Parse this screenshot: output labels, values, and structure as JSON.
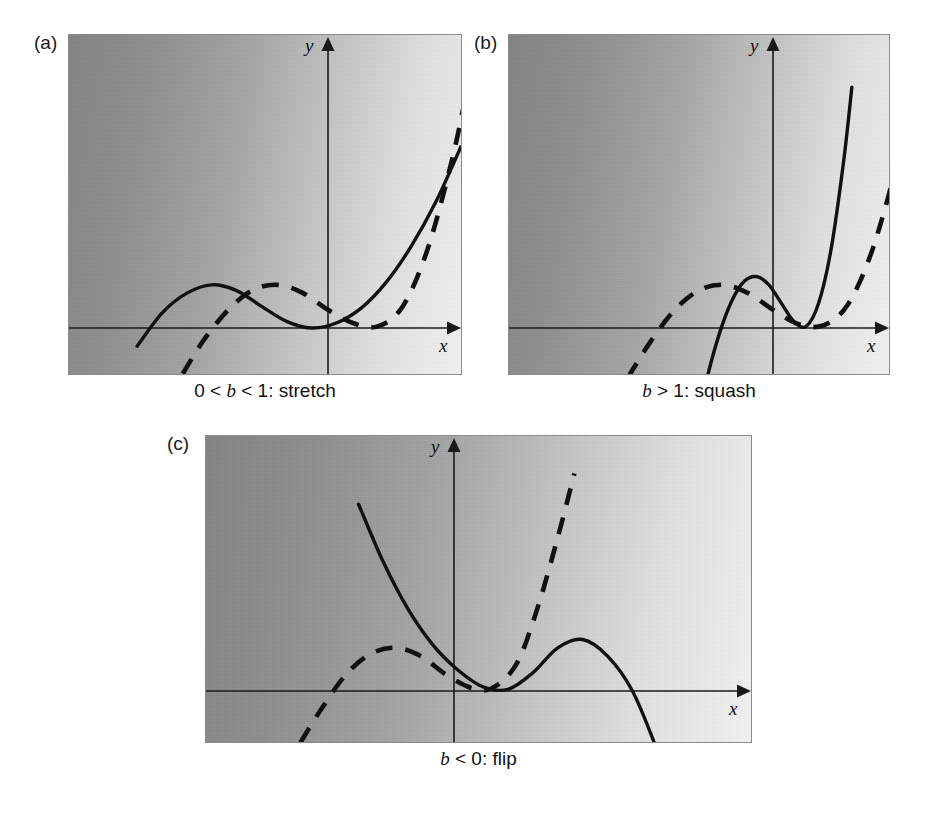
{
  "figure": {
    "background": "#ffffff",
    "curve_color": "#111111",
    "axis_color": "#1a1a1a",
    "panel_border_color": "#8c8c8c",
    "gradient_from": "#848484",
    "gradient_to": "#f4f4f4"
  },
  "panels": [
    {
      "id": "a",
      "label": "(a)",
      "caption_prefix": "0 < ",
      "caption_var": "b",
      "caption_suffix": " < 1: stretch",
      "caption_full": "0 < b < 1: stretch",
      "x_axis_label": "x",
      "y_axis_label": "y",
      "box": {
        "left": 68,
        "top": 34,
        "width": 394,
        "height": 341
      },
      "origin": {
        "x": 259,
        "y": 293
      },
      "label_pos": {
        "left": 34,
        "top": 32
      },
      "caption_pos": {
        "left": 68,
        "top": 380,
        "width": 394
      }
    },
    {
      "id": "b",
      "label": "(b)",
      "caption_prefix": "",
      "caption_var": "b",
      "caption_suffix": " > 1: squash",
      "caption_full": "b > 1: squash",
      "x_axis_label": "x",
      "y_axis_label": "y",
      "box": {
        "left": 508,
        "top": 34,
        "width": 382,
        "height": 341
      },
      "origin": {
        "x": 264,
        "y": 293
      },
      "label_pos": {
        "left": 474,
        "top": 32
      },
      "caption_pos": {
        "left": 508,
        "top": 380,
        "width": 382
      }
    },
    {
      "id": "c",
      "label": "(c)",
      "caption_prefix": "",
      "caption_var": "b",
      "caption_suffix": " < 0: flip",
      "caption_full": "b < 0: flip",
      "x_axis_label": "x",
      "y_axis_label": "y",
      "box": {
        "left": 205,
        "top": 435,
        "width": 547,
        "height": 308
      },
      "origin": {
        "x": 248,
        "y": 255
      },
      "label_pos": {
        "left": 167,
        "top": 433
      },
      "caption_pos": {
        "left": 205,
        "top": 748,
        "width": 547
      }
    }
  ],
  "chart_data": {
    "type": "line",
    "xlabel": "x",
    "ylabel": "y",
    "grid": false,
    "legend": "none",
    "annotations": [
      "(a) 0 < b < 1: stretch",
      "(b) b > 1: squash",
      "(c) b < 0: flip"
    ],
    "base_function": {
      "name": "f(x)",
      "form": "cubic with local max then local min then rising",
      "roots_x": [
        -1.35,
        0.55,
        0.55
      ],
      "local_max_x": -0.75,
      "local_min_x": 0.55,
      "expression": "k*(x + 1.35)*(x - 0.55)^2",
      "k": 1.0
    },
    "panels": [
      {
        "id": "a",
        "caption": "0 < b < 1: stretch",
        "solid": {
          "style": "solid",
          "name": "y = f(bx), 0 < b < 1",
          "b": 0.6,
          "points_xy": [
            [
              -2.3,
              -0.22
            ],
            [
              -2.0,
              0.18
            ],
            [
              -1.7,
              0.42
            ],
            [
              -1.4,
              0.52
            ],
            [
              -1.1,
              0.45
            ],
            [
              -0.8,
              0.26
            ],
            [
              -0.5,
              0.08
            ],
            [
              -0.2,
              0.0
            ],
            [
              0.1,
              0.06
            ],
            [
              0.4,
              0.24
            ],
            [
              0.7,
              0.55
            ],
            [
              1.0,
              0.98
            ],
            [
              1.3,
              1.52
            ],
            [
              1.6,
              2.18
            ]
          ]
        },
        "dashed": {
          "style": "dashed",
          "name": "y = f(x) original",
          "b": 1.0,
          "points_xy": [
            [
              -1.75,
              -0.55
            ],
            [
              -1.5,
              -0.15
            ],
            [
              -1.2,
              0.22
            ],
            [
              -0.9,
              0.46
            ],
            [
              -0.6,
              0.52
            ],
            [
              -0.3,
              0.42
            ],
            [
              0.0,
              0.22
            ],
            [
              0.3,
              0.06
            ],
            [
              0.6,
              0.02
            ],
            [
              0.9,
              0.26
            ],
            [
              1.2,
              0.95
            ],
            [
              1.5,
              2.05
            ],
            [
              1.7,
              3.0
            ]
          ]
        }
      },
      {
        "id": "b",
        "caption": "b > 1: squash",
        "solid": {
          "style": "solid",
          "name": "y = f(bx), b > 1",
          "b": 1.7,
          "points_xy": [
            [
              -0.95,
              -1.25
            ],
            [
              -0.8,
              -0.62
            ],
            [
              -0.65,
              -0.08
            ],
            [
              -0.5,
              0.32
            ],
            [
              -0.35,
              0.56
            ],
            [
              -0.2,
              0.62
            ],
            [
              -0.05,
              0.52
            ],
            [
              0.1,
              0.3
            ],
            [
              0.25,
              0.08
            ],
            [
              0.4,
              0.02
            ],
            [
              0.55,
              0.3
            ],
            [
              0.7,
              0.95
            ],
            [
              0.85,
              2.0
            ],
            [
              0.95,
              2.9
            ]
          ]
        },
        "dashed": {
          "style": "dashed",
          "name": "y = f(x) original",
          "b": 1.0,
          "points_xy": [
            [
              -1.75,
              -0.6
            ],
            [
              -1.5,
              -0.2
            ],
            [
              -1.2,
              0.2
            ],
            [
              -0.9,
              0.45
            ],
            [
              -0.6,
              0.52
            ],
            [
              -0.3,
              0.42
            ],
            [
              0.0,
              0.22
            ],
            [
              0.3,
              0.05
            ],
            [
              0.6,
              0.03
            ],
            [
              0.9,
              0.28
            ],
            [
              1.2,
              0.95
            ],
            [
              1.5,
              2.0
            ],
            [
              1.7,
              2.85
            ]
          ]
        }
      },
      {
        "id": "c",
        "caption": "b < 0: flip",
        "solid": {
          "style": "solid",
          "name": "y = f(bx), b < 0 (mirrored)",
          "b": -1.0,
          "points_xy": [
            [
              -1.15,
              2.25
            ],
            [
              -0.85,
              1.55
            ],
            [
              -0.55,
              0.98
            ],
            [
              -0.25,
              0.55
            ],
            [
              0.05,
              0.25
            ],
            [
              0.35,
              0.05
            ],
            [
              0.65,
              0.02
            ],
            [
              0.95,
              0.22
            ],
            [
              1.25,
              0.52
            ],
            [
              1.55,
              0.62
            ],
            [
              1.85,
              0.42
            ],
            [
              2.15,
              0.0
            ],
            [
              2.45,
              -0.72
            ],
            [
              2.6,
              -1.18
            ]
          ]
        },
        "dashed": {
          "style": "dashed",
          "name": "y = f(x) original",
          "b": 1.0,
          "points_xy": [
            [
              -1.85,
              -0.62
            ],
            [
              -1.6,
              -0.22
            ],
            [
              -1.3,
              0.2
            ],
            [
              -1.0,
              0.45
            ],
            [
              -0.7,
              0.52
            ],
            [
              -0.4,
              0.42
            ],
            [
              -0.1,
              0.2
            ],
            [
              0.2,
              0.04
            ],
            [
              0.45,
              0.03
            ],
            [
              0.75,
              0.32
            ],
            [
              1.0,
              0.98
            ],
            [
              1.25,
              1.85
            ],
            [
              1.45,
              2.62
            ]
          ]
        }
      }
    ]
  }
}
